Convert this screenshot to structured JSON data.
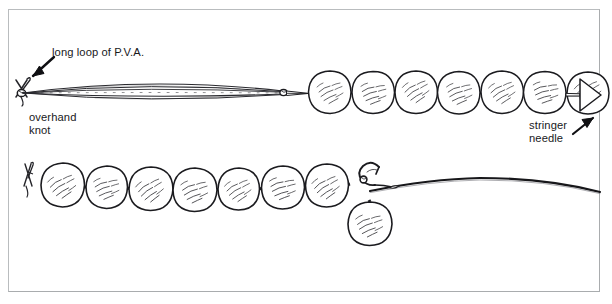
{
  "figure": {
    "kind": "line-drawing",
    "background_color": "#ffffff",
    "ink_color": "#1a1a1d",
    "frame_color": "#b9bcbe",
    "width": 612,
    "height": 304
  },
  "labels": {
    "pva_loop": "long loop of P.V.A.",
    "overhand_knot": "overhand\nknot",
    "stringer_needle": "stringer\nneedle"
  },
  "icons": {
    "arrow_pva": "arrow-down-left-icon",
    "arrow_needle": "arrow-up-right-icon"
  },
  "diagram": {
    "top_row": {
      "name": "stringer-being-threaded",
      "overhand_knot_point": {
        "x": 22,
        "y": 93
      },
      "pva_loop": {
        "start_x": 22,
        "end_x": 292,
        "center_y": 93,
        "max_half_height": 11,
        "strand_count": 5,
        "pinch_x": 283
      },
      "baits": [
        {
          "cx": 330,
          "cy": 92,
          "r": 21
        },
        {
          "cx": 373,
          "cy": 92,
          "r": 21
        },
        {
          "cx": 416,
          "cy": 92,
          "r": 21
        },
        {
          "cx": 459,
          "cy": 92,
          "r": 21
        },
        {
          "cx": 502,
          "cy": 92,
          "r": 21
        },
        {
          "cx": 545,
          "cy": 92,
          "r": 21
        },
        {
          "cx": 588,
          "cy": 92,
          "r": 21
        }
      ],
      "needle": {
        "shaft_from_x": 566,
        "shaft_to_x": 578,
        "shaft_y": 95,
        "handle_points": "578,80 600,96 578,112"
      }
    },
    "bottom_row": {
      "name": "finished-stringer-on-hook",
      "end_knot": {
        "x": 27,
        "y": 184
      },
      "baits": [
        {
          "cx": 62,
          "cy": 185,
          "r": 22
        },
        {
          "cx": 106,
          "cy": 187,
          "r": 21
        },
        {
          "cx": 150,
          "cy": 189,
          "r": 22
        },
        {
          "cx": 194,
          "cy": 190,
          "r": 22
        },
        {
          "cx": 238,
          "cy": 189,
          "r": 21
        },
        {
          "cx": 282,
          "cy": 188,
          "r": 22
        },
        {
          "cx": 326,
          "cy": 186,
          "r": 22
        },
        {
          "cx": 369,
          "cy": 224,
          "r": 22
        }
      ],
      "hook": {
        "eye_x": 360,
        "eye_y": 181,
        "bend_cx": 368,
        "bend_cy": 180,
        "point_x": 378,
        "point_y": 167
      },
      "line": {
        "from_x": 372,
        "from_y": 190,
        "to_x": 600,
        "to_y": 192,
        "crest_y": 178
      }
    }
  }
}
